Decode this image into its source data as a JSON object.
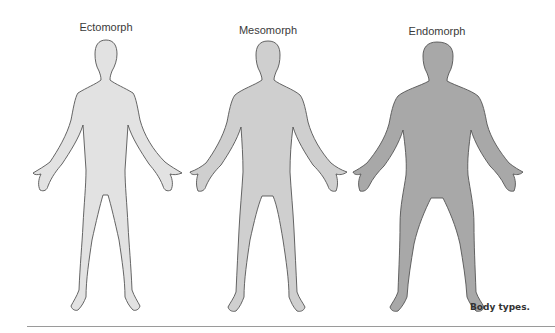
{
  "figure": {
    "caption": "Body types.",
    "body_types": [
      {
        "label": "Ectomorph",
        "fill": "#e2e2e2"
      },
      {
        "label": "Mesomorph",
        "fill": "#cfcfcf"
      },
      {
        "label": "Endomorph",
        "fill": "#a8a8a8"
      }
    ],
    "outline_color": "#555555"
  }
}
